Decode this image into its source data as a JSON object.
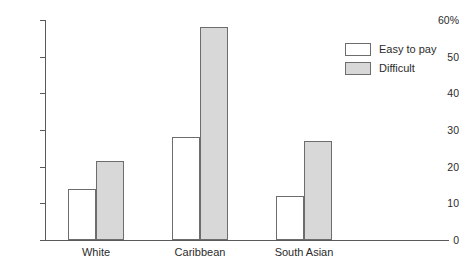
{
  "chart_data": {
    "type": "bar",
    "title": "",
    "subtitle": "",
    "xlabel": "",
    "ylabel": "",
    "categories": [
      "White",
      "Caribbean",
      "South Asian"
    ],
    "series": [
      {
        "name": "Easy to pay",
        "values": [
          14,
          28,
          12
        ],
        "color": "#ffffff"
      },
      {
        "name": "Difficult",
        "values": [
          21.5,
          58,
          27
        ],
        "color": "#d8d8d8"
      }
    ],
    "ylim": [
      0,
      60
    ],
    "ytick_values": [
      0,
      10,
      20,
      30,
      40,
      50,
      60
    ],
    "ytick_labels": [
      "0",
      "10",
      "20",
      "30",
      "40",
      "50",
      "60%"
    ],
    "grid": false,
    "legend_position": "top-right",
    "annotations": []
  },
  "legend": {
    "entries": [
      {
        "label": "Easy to pay"
      },
      {
        "label": "Difficult"
      }
    ]
  }
}
